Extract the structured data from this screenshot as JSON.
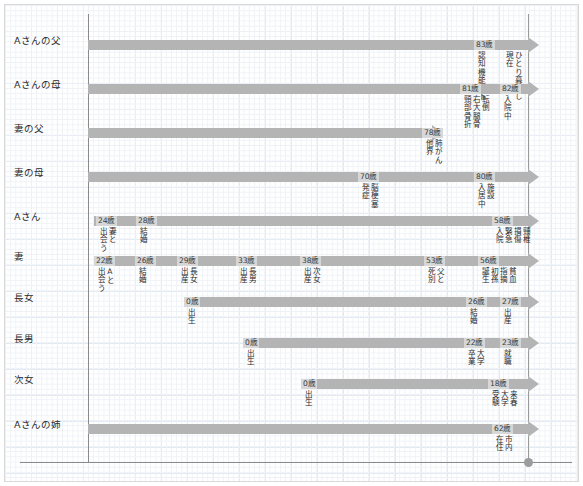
{
  "chart_data": {
    "type": "table",
    "title": "",
    "xlabel": "",
    "ylabel": "",
    "grid": true,
    "legend_position": "none",
    "axis_note": "horizontal axis = age / life course; vertical reference line = present time",
    "rows": [
      {
        "label": "Aさんの父",
        "bar_start_px": 88,
        "bar_width_px": 440,
        "events": [
          {
            "age": "83歳",
            "age_x_px": 474,
            "columns": [
              "認知機能低下"
            ],
            "column_split": [
              "認知",
              "機能",
              "低下"
            ]
          },
          {
            "age": "",
            "age_x_px": 502,
            "columns": [
              "ひとり暮らし",
              "現在"
            ]
          }
        ]
      },
      {
        "label": "Aさんの母",
        "bar_start_px": 88,
        "bar_width_px": 440,
        "events": [
          {
            "age": "81歳",
            "age_x_px": 460,
            "columns": [
              "転倒",
              "右大腿骨",
              "頸部骨折"
            ]
          },
          {
            "age": "82歳",
            "age_x_px": 500,
            "columns": [
              "入院中"
            ]
          }
        ]
      },
      {
        "label": "妻の父",
        "bar_start_px": 88,
        "bar_width_px": 344,
        "events": [
          {
            "age": "78歳",
            "age_x_px": 422,
            "columns": [
              "肺がん",
              "他界"
            ]
          }
        ]
      },
      {
        "label": "妻の母",
        "bar_start_px": 88,
        "bar_width_px": 440,
        "events": [
          {
            "age": "70歳",
            "age_x_px": 358,
            "columns": [
              "脳梗塞",
              "発症"
            ]
          },
          {
            "age": "80歳",
            "age_x_px": 474,
            "columns": [
              "施設",
              "入居中"
            ]
          }
        ]
      },
      {
        "label": "Aさん",
        "bar_start_px": 94,
        "bar_width_px": 434,
        "events": [
          {
            "age": "24歳",
            "age_x_px": 96,
            "columns": [
              "妻と",
              "出会う"
            ]
          },
          {
            "age": "28歳",
            "age_x_px": 136,
            "columns": [
              "結婚"
            ]
          },
          {
            "age": "58歳",
            "age_x_px": 492,
            "columns": [
              "頸椎",
              "損傷",
              "緊急",
              "入院"
            ]
          }
        ]
      },
      {
        "label": "妻",
        "bar_start_px": 94,
        "bar_width_px": 434,
        "events": [
          {
            "age": "22歳",
            "age_x_px": 94,
            "columns": [
              "Aと",
              "出会う"
            ]
          },
          {
            "age": "26歳",
            "age_x_px": 135,
            "columns": [
              "結婚"
            ]
          },
          {
            "age": "29歳",
            "age_x_px": 177,
            "columns": [
              "長女",
              "出産"
            ]
          },
          {
            "age": "33歳",
            "age_x_px": 236,
            "columns": [
              "長男",
              "出産"
            ]
          },
          {
            "age": "38歳",
            "age_x_px": 300,
            "columns": [
              "次女",
              "出産"
            ]
          },
          {
            "age": "53歳",
            "age_x_px": 424,
            "columns": [
              "父と",
              "死別"
            ]
          },
          {
            "age": "56歳",
            "age_x_px": 478,
            "columns": [
              "貧血",
              "指摘",
              "初孫",
              "誕生"
            ]
          }
        ]
      },
      {
        "label": "長女",
        "bar_start_px": 184,
        "bar_width_px": 344,
        "events": [
          {
            "age": "0歳",
            "age_x_px": 184,
            "columns": [
              "出生"
            ]
          },
          {
            "age": "26歳",
            "age_x_px": 466,
            "columns": [
              "結婚"
            ]
          },
          {
            "age": "27歳",
            "age_x_px": 500,
            "columns": [
              "出産"
            ]
          }
        ]
      },
      {
        "label": "長男",
        "bar_start_px": 243,
        "bar_width_px": 285,
        "events": [
          {
            "age": "0歳",
            "age_x_px": 243,
            "columns": [
              "出生"
            ]
          },
          {
            "age": "22歳",
            "age_x_px": 464,
            "columns": [
              "大学",
              "卒業"
            ]
          },
          {
            "age": "23歳",
            "age_x_px": 500,
            "columns": [
              "就職"
            ]
          }
        ]
      },
      {
        "label": "次女",
        "bar_start_px": 301,
        "bar_width_px": 227,
        "events": [
          {
            "age": "0歳",
            "age_x_px": 301,
            "columns": [
              "出生"
            ]
          },
          {
            "age": "18歳",
            "age_x_px": 488,
            "columns": [
              "来春",
              "大学",
              "受験"
            ]
          }
        ]
      },
      {
        "label": "Aさんの姉",
        "bar_start_px": 88,
        "bar_width_px": 440,
        "events": [
          {
            "age": "62歳",
            "age_x_px": 492,
            "columns": [
              "市内",
              "在住"
            ]
          }
        ]
      }
    ],
    "row_y_px": [
      40,
      84,
      128,
      172,
      216,
      256,
      297,
      338,
      379,
      424
    ],
    "colors": {
      "bar": "#b4b4b4",
      "age_chip": "#d7d7d7",
      "axis": "#8a8a8a",
      "grid_minor": "#eef2f7",
      "grid_major": "#e2e9f1",
      "text": "#2b2b2b",
      "frame": "#d9d9d9"
    }
  }
}
